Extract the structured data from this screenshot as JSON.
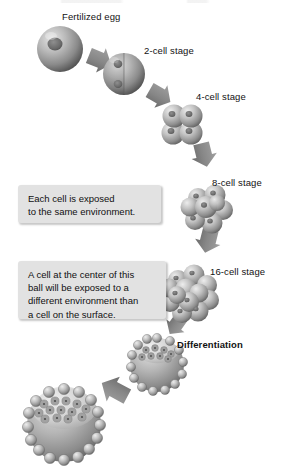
{
  "figure": {
    "background_color": "#ffffff",
    "width": 285,
    "height": 468
  },
  "palette": {
    "cell_light": "#d8d8d8",
    "cell_mid": "#9a9a9a",
    "cell_dark": "#5d5d5d",
    "cell_shadow": "#3d3d3d",
    "arrow_fill": "#8c8c8c",
    "arrow_dark": "#6f6f6f",
    "callout_bg": "#e2e2e2",
    "text_color": "#101010"
  },
  "stages": [
    {
      "id": "fertilized-egg",
      "label": "Fertilized egg",
      "label_x": 62,
      "label_y": 11,
      "cx": 60,
      "cy": 49,
      "r": 23,
      "kind": "single-cell",
      "nuclei": 1
    },
    {
      "id": "two-cell",
      "label": "2-cell stage",
      "label_x": 144,
      "label_y": 45,
      "cx": 124,
      "cy": 74,
      "r": 21,
      "kind": "two-cell",
      "nuclei": 2
    },
    {
      "id": "four-cell",
      "label": "4-cell stage",
      "label_x": 196,
      "label_y": 91,
      "cx": 182,
      "cy": 124,
      "r": 20,
      "kind": "cluster",
      "nuclei": 4
    },
    {
      "id": "eight-cell",
      "label": "8-cell stage",
      "label_x": 212,
      "label_y": 177,
      "cx": 209,
      "cy": 208,
      "r": 22,
      "kind": "cluster",
      "nuclei": 8
    },
    {
      "id": "sixteen-cell",
      "label": "16-cell stage",
      "label_x": 210,
      "label_y": 266,
      "cx": 189,
      "cy": 292,
      "r": 24,
      "kind": "cluster",
      "nuclei": 16
    },
    {
      "id": "blastocyst-early",
      "label": "Differentiation",
      "label_x": 177,
      "label_y": 339,
      "label_bold": true,
      "cx": 157,
      "cy": 365,
      "r": 27,
      "kind": "blastocyst"
    },
    {
      "id": "blastocyst-late",
      "label": "",
      "cx": 64,
      "cy": 425,
      "r": 37,
      "kind": "blastocyst"
    }
  ],
  "callouts": [
    {
      "id": "callout-same-environment",
      "text": "Each cell is exposed\nto the same environment.",
      "x": 18,
      "y": 185,
      "width": 143,
      "height": 38
    },
    {
      "id": "callout-different-environment",
      "text": "A cell at the center of this\nball will be exposed to a\ndifferent environment than\na cell on the surface.",
      "x": 18,
      "y": 261,
      "width": 148,
      "height": 58
    }
  ],
  "arrows": [
    {
      "id": "arrow-egg-to-2cell",
      "x1": 91,
      "y1": 58,
      "x2": 111,
      "y2": 70,
      "width": 13
    },
    {
      "id": "arrow-2cell-to-4cell",
      "x1": 150,
      "y1": 93,
      "x2": 172,
      "y2": 110,
      "width": 13
    },
    {
      "id": "arrow-4cell-to-8cell",
      "x1": 196,
      "y1": 148,
      "x2": 204,
      "y2": 184,
      "width": 13
    },
    {
      "id": "arrow-8cell-to-16cell",
      "x1": 211,
      "y1": 234,
      "x2": 197,
      "y2": 266,
      "width": 13
    },
    {
      "id": "arrow-16cell-to-blast",
      "x1": 182,
      "y1": 320,
      "x2": 168,
      "y2": 341,
      "width": 13
    },
    {
      "id": "arrow-blast-to-blast",
      "x1": 131,
      "y1": 382,
      "x2": 98,
      "y2": 400,
      "width": 14
    }
  ]
}
